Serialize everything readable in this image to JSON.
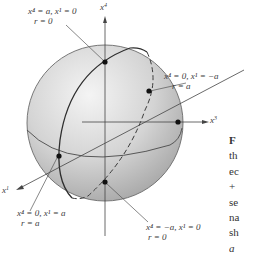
{
  "diagram": {
    "type": "sphere-coordinate-diagram",
    "sphere": {
      "fill_light": "#f2f2f2",
      "fill_dark": "#a9a9a9",
      "stroke": "#555555"
    },
    "axes": [
      {
        "id": "x4",
        "base": "x",
        "sup": "4"
      },
      {
        "id": "x3",
        "base": "x",
        "sup": "3"
      },
      {
        "id": "x1",
        "base": "x",
        "sup": "1"
      }
    ],
    "points": [
      {
        "id": "top",
        "line1": "x⁴ = a, x¹ = 0",
        "line2": "r = 0"
      },
      {
        "id": "back",
        "line1": "x⁴ = 0, x¹ = −a",
        "line2": "r = a"
      },
      {
        "id": "front",
        "line1": "x⁴ = 0, x¹ = a",
        "line2": "r = a"
      },
      {
        "id": "bottom",
        "line1": "x⁴ = −a, x¹ = 0",
        "line2": "r = 0"
      }
    ]
  },
  "caption_fragments": [
    "F",
    "th",
    "ec",
    "+",
    "se",
    "na",
    "sh",
    "a"
  ]
}
